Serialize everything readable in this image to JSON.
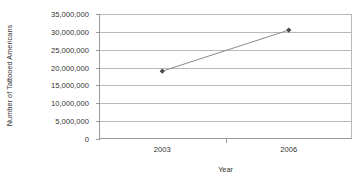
{
  "chart_data": {
    "type": "line",
    "title": "",
    "xlabel": "Year",
    "ylabel": "Number of Tattooed Americans",
    "categories": [
      "2003",
      "2006"
    ],
    "x": [
      2003,
      2006
    ],
    "values": [
      19000000,
      30500000
    ],
    "series": [
      {
        "name": "Number of Tattooed Americans",
        "values": [
          19000000,
          30500000
        ]
      }
    ],
    "ylim": [
      0,
      35000000
    ],
    "ytick_labels": [
      "35,000,000",
      "30,000,000",
      "25,000,000",
      "20,000,000",
      "15,000,000",
      "10,000,000",
      "5,000,000",
      "0"
    ],
    "ytick_values": [
      35000000,
      30000000,
      25000000,
      20000000,
      15000000,
      10000000,
      5000000,
      0
    ],
    "xtick_labels": [
      "2003",
      "2006"
    ],
    "grid": true,
    "legend": false,
    "marker": "diamond",
    "line_color": "#8a8a8a",
    "marker_color": "#4a4a4a",
    "grid_color": "#b9b9b9",
    "axis_color": "#9a9a9a",
    "text_color": "#333333",
    "background": "#ffffff"
  }
}
